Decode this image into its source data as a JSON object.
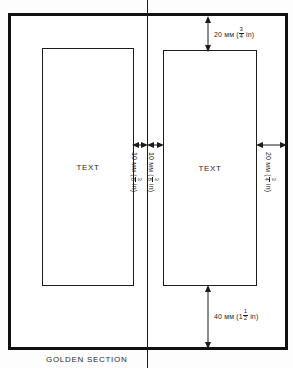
{
  "diagram": {
    "caption": "GOLDEN SECTION",
    "text_block_label": "TEXT",
    "page_frame_name": "page-outer-frame",
    "fold_name": "center-fold-line",
    "dimensions": {
      "top_margin": {
        "value": "20",
        "unit": "мм",
        "imperial_whole": "",
        "imperial_num": "3",
        "imperial_den": "4",
        "imperial_unit": "in",
        "full_text": "20 мм (¾ in)"
      },
      "outer_margin": {
        "value": "20",
        "unit": "мм",
        "imperial_whole": "",
        "imperial_num": "3",
        "imperial_den": "4",
        "imperial_unit": "in",
        "full_text": "20 мм (¾ in)"
      },
      "gutter_left": {
        "value": "10",
        "unit": "мм",
        "imperial_whole": "",
        "imperial_num": "3",
        "imperial_den": "8",
        "imperial_unit": "in",
        "full_text": "10 мм (⅜ in)"
      },
      "gutter_right": {
        "value": "10",
        "unit": "мм",
        "imperial_whole": "",
        "imperial_num": "3",
        "imperial_den": "8",
        "imperial_unit": "in",
        "full_text": "10 мм (⅜ in)"
      },
      "bottom_margin": {
        "value": "40",
        "unit": "мм",
        "imperial_whole": "1",
        "imperial_num": "1",
        "imperial_den": "2",
        "imperial_unit": "in",
        "full_text": "40 мм (1½ in)"
      }
    },
    "colors": {
      "ink": "#111111",
      "line": "#1d1d1d",
      "paper": "#ffffff"
    }
  }
}
